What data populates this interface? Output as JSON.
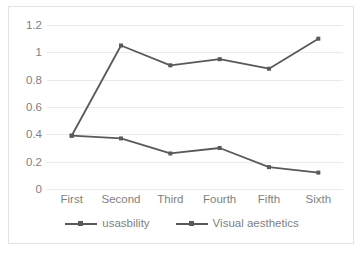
{
  "chart_data": {
    "type": "line",
    "title": "",
    "xlabel": "",
    "ylabel": "",
    "categories": [
      "First",
      "Second",
      "Third",
      "Fourth",
      "Fifth",
      "Sixth"
    ],
    "series": [
      {
        "name": "usasbility",
        "values": [
          0.39,
          1.05,
          0.905,
          0.95,
          0.88,
          1.1
        ],
        "color": "#595959"
      },
      {
        "name": "Visual aesthetics",
        "values": [
          0.39,
          0.37,
          0.26,
          0.3,
          0.16,
          0.12
        ],
        "color": "#595959"
      }
    ],
    "ylim": [
      0,
      1.2
    ],
    "yticks": [
      "0",
      "0.2",
      "0.4",
      "0.6",
      "0.8",
      "1",
      "1.2"
    ],
    "ytick_values": [
      0,
      0.2,
      0.4,
      0.6,
      0.8,
      1,
      1.2
    ],
    "grid": true,
    "legend_position": "bottom",
    "marker": "square"
  },
  "axes": {
    "y_ticks": [
      "1.2",
      "1",
      "0.8",
      "0.6",
      "0.4",
      "0.2",
      "0"
    ],
    "x_ticks": [
      "First",
      "Second",
      "Third",
      "Fourth",
      "Fifth",
      "Sixth"
    ]
  },
  "legend": {
    "items": [
      {
        "label": "usasbility"
      },
      {
        "label": "Visual aesthetics"
      }
    ]
  },
  "colors": {
    "line": "#595959",
    "grid": "#eceaea",
    "text": "#7f7f7f",
    "frame": "#e2e2e2",
    "background": "#ffffff"
  }
}
